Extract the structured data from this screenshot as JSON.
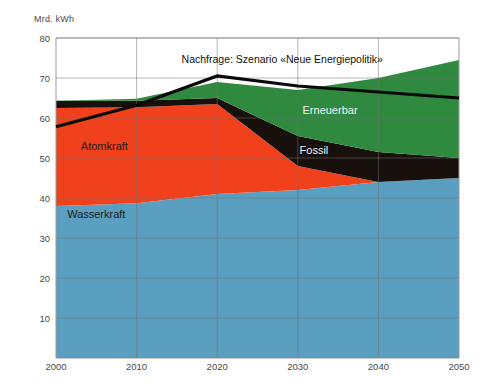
{
  "chart_data": {
    "type": "area",
    "title": "",
    "ylabel": "Mrd. kWh",
    "xlabel": "",
    "ylim": [
      0,
      80
    ],
    "xlim": [
      2000,
      2050
    ],
    "grid": true,
    "legend_position": "inline-labels",
    "x": [
      2000,
      2010,
      2020,
      2030,
      2040,
      2050
    ],
    "ytick_labels": [
      "80",
      "70",
      "60",
      "50",
      "40",
      "30",
      "20",
      "10"
    ],
    "ytick_values": [
      80,
      70,
      60,
      50,
      40,
      30,
      20,
      10
    ],
    "xtick_labels": [
      "2000",
      "2010",
      "2020",
      "2030",
      "2040",
      "2050"
    ],
    "series": [
      {
        "name": "Wasserkraft",
        "color": "#5b9fc0",
        "label_x": 2005,
        "label_y": 36,
        "label_color": "dark",
        "values": [
          38.0,
          38.7,
          41.0,
          42.0,
          44.0,
          45.0
        ]
      },
      {
        "name": "Atomkraft",
        "color": "#f1411c",
        "label_x": 2006,
        "label_y": 53,
        "label_color": "dark",
        "values": [
          24.5,
          24.0,
          22.5,
          6.0,
          0.0,
          0.0
        ]
      },
      {
        "name": "Fossil",
        "color": "#17100c",
        "label_x": 2032,
        "label_y": 52,
        "label_color": "light",
        "values": [
          1.8,
          1.6,
          1.5,
          7.5,
          7.5,
          5.0
        ]
      },
      {
        "name": "Erneuerbar",
        "color": "#2f8a3f",
        "label_x": 2034,
        "label_y": 62,
        "label_color": "light",
        "values": [
          0.0,
          0.5,
          4.0,
          11.5,
          18.5,
          24.5
        ]
      }
    ],
    "demand_line": {
      "name": "Nachfrage: Szenario «Neue Energiepolitik»",
      "color": "#0a0a0a",
      "values": [
        57.8,
        63.2,
        70.5,
        68.0,
        66.5,
        65.0
      ],
      "label": "Nachfrage: Szenario «Neue Energiepolitik»",
      "label_x": 2026,
      "label_y": 74.5
    }
  },
  "stack_tops": {
    "note": "cumulative totals per year",
    "values": [
      64.3,
      64.8,
      69.0,
      67.0,
      70.0,
      74.5
    ]
  }
}
